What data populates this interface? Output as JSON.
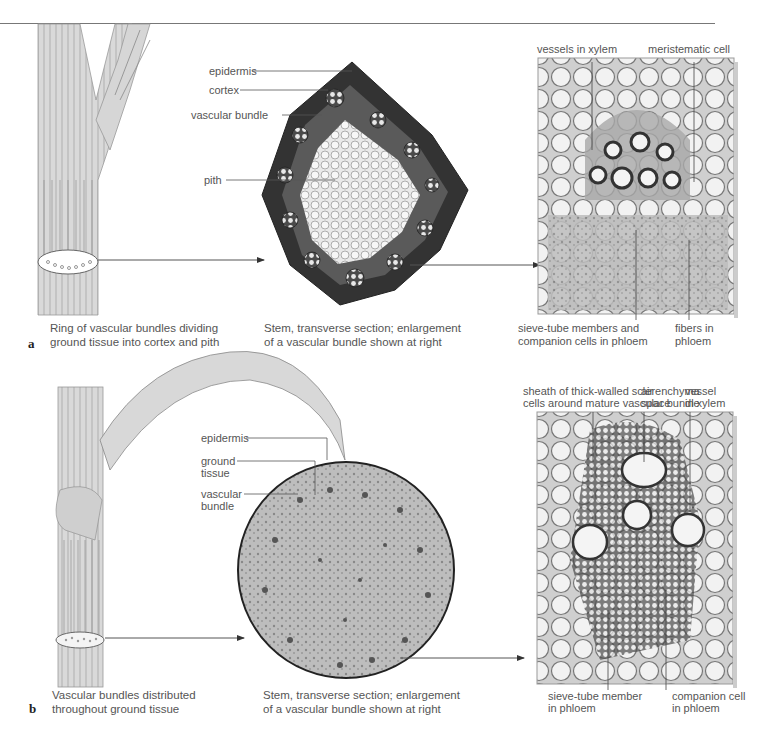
{
  "figure": {
    "panels": [
      {
        "id": "a",
        "part_label": "a",
        "stem_illustration": {
          "caption_line1": "Ring of vascular bundles dividing",
          "caption_line2": "ground tissue into cortex and pith"
        },
        "section": {
          "labels": [
            "epidermis",
            "cortex",
            "vascular bundle",
            "pith"
          ],
          "caption_line1": "Stem, transverse section; enlargement",
          "caption_line2": "of a vascular bundle shown at right"
        },
        "micrograph": {
          "top_labels": [
            "vessels in xylem",
            "meristematic cell"
          ],
          "bottom_labels": [
            {
              "line1": "sieve-tube members and",
              "line2": "companion cells in phloem"
            },
            {
              "line1": "fibers in",
              "line2": "phloem"
            }
          ]
        }
      },
      {
        "id": "b",
        "part_label": "b",
        "stem_illustration": {
          "caption_line1": "Vascular bundles distributed",
          "caption_line2": "throughout ground tissue"
        },
        "section": {
          "labels": [
            {
              "line1": "epidermis",
              "line2": ""
            },
            {
              "line1": "ground",
              "line2": "tissue"
            },
            {
              "line1": "vascular",
              "line2": "bundle"
            }
          ],
          "caption_line1": "Stem, transverse section; enlargement",
          "caption_line2": "of a vascular bundle shown at right"
        },
        "micrograph": {
          "top_labels": [
            {
              "line1": "sheath of thick-walled sclerenchyma",
              "line2": "cells around mature vascular bundle"
            },
            {
              "line1": "air",
              "line2": "space"
            },
            {
              "line1": "vessel",
              "line2": "in xylem"
            }
          ],
          "bottom_labels": [
            {
              "line1": "sieve-tube member",
              "line2": "in phloem"
            },
            {
              "line1": "companion cell",
              "line2": "in phloem"
            }
          ]
        }
      }
    ],
    "colors": {
      "text": "#555555",
      "line": "#444444",
      "tissue_dark": "#3a3a3a",
      "tissue_light": "#e6e6e6"
    }
  }
}
